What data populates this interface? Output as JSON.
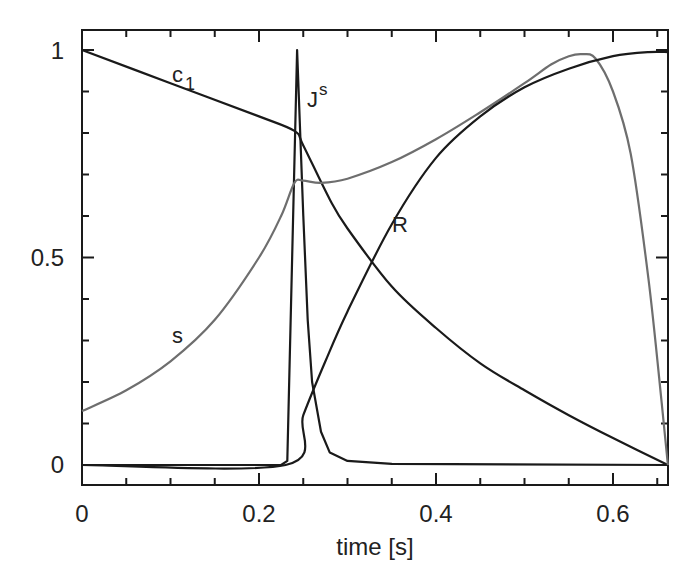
{
  "chart_data": {
    "type": "line",
    "title": "",
    "xlabel": "time [s]",
    "ylabel": "",
    "xlim": [
      0,
      0.662
    ],
    "ylim": [
      -0.05,
      1.05
    ],
    "grid": false,
    "legend": "inline labels",
    "x_ticks": [
      "0",
      "0.2",
      "0.4",
      "0.6"
    ],
    "y_ticks": [
      "0",
      "0.5",
      "1"
    ],
    "series": [
      {
        "name": "c1",
        "label_main": "c",
        "label_sub": "1",
        "color": "#1a1a1a",
        "points": [
          [
            0,
            1.0
          ],
          [
            0.1,
            0.92
          ],
          [
            0.2,
            0.84
          ],
          [
            0.24,
            0.805
          ],
          [
            0.25,
            0.77
          ],
          [
            0.28,
            0.64
          ],
          [
            0.3,
            0.57
          ],
          [
            0.35,
            0.43
          ],
          [
            0.4,
            0.33
          ],
          [
            0.45,
            0.245
          ],
          [
            0.5,
            0.18
          ],
          [
            0.55,
            0.12
          ],
          [
            0.6,
            0.065
          ],
          [
            0.662,
            0.0
          ]
        ]
      },
      {
        "name": "Js",
        "label_main": "J",
        "label_sup": "s",
        "color": "#1a1a1a",
        "points": [
          [
            0,
            0.0
          ],
          [
            0.225,
            0.0
          ],
          [
            0.232,
            0.01
          ],
          [
            0.243,
            1.0
          ],
          [
            0.25,
            0.6
          ],
          [
            0.255,
            0.35
          ],
          [
            0.26,
            0.2
          ],
          [
            0.27,
            0.08
          ],
          [
            0.28,
            0.03
          ],
          [
            0.3,
            0.01
          ],
          [
            0.35,
            0.003
          ],
          [
            0.662,
            0.0
          ]
        ]
      },
      {
        "name": "s",
        "label_main": "s",
        "color": "#6e6e6e",
        "points": [
          [
            0,
            0.13
          ],
          [
            0.05,
            0.18
          ],
          [
            0.1,
            0.25
          ],
          [
            0.15,
            0.35
          ],
          [
            0.2,
            0.5
          ],
          [
            0.225,
            0.6
          ],
          [
            0.24,
            0.68
          ],
          [
            0.25,
            0.685
          ],
          [
            0.27,
            0.68
          ],
          [
            0.3,
            0.69
          ],
          [
            0.35,
            0.73
          ],
          [
            0.4,
            0.785
          ],
          [
            0.45,
            0.85
          ],
          [
            0.5,
            0.92
          ],
          [
            0.53,
            0.965
          ],
          [
            0.55,
            0.985
          ],
          [
            0.565,
            0.99
          ],
          [
            0.58,
            0.98
          ],
          [
            0.6,
            0.9
          ],
          [
            0.62,
            0.75
          ],
          [
            0.64,
            0.45
          ],
          [
            0.655,
            0.15
          ],
          [
            0.662,
            0.0
          ]
        ]
      },
      {
        "name": "R",
        "label_main": "R",
        "color": "#1a1a1a",
        "points": [
          [
            0,
            0.0
          ],
          [
            0.23,
            0.0
          ],
          [
            0.25,
            0.12
          ],
          [
            0.275,
            0.25
          ],
          [
            0.3,
            0.37
          ],
          [
            0.35,
            0.58
          ],
          [
            0.4,
            0.74
          ],
          [
            0.45,
            0.84
          ],
          [
            0.5,
            0.91
          ],
          [
            0.55,
            0.955
          ],
          [
            0.6,
            0.985
          ],
          [
            0.64,
            0.995
          ],
          [
            0.662,
            0.995
          ]
        ]
      }
    ]
  },
  "labels": {
    "x_axis_title": "time [s]",
    "x_tick_0": "0",
    "x_tick_1": "0.2",
    "x_tick_2": "0.4",
    "x_tick_3": "0.6",
    "y_tick_0": "0",
    "y_tick_1": "0.5",
    "y_tick_2": "1",
    "c1_main": "c",
    "c1_sub": "1",
    "js_main": "J",
    "js_sup": "s",
    "s_label": "s",
    "r_label": "R"
  }
}
